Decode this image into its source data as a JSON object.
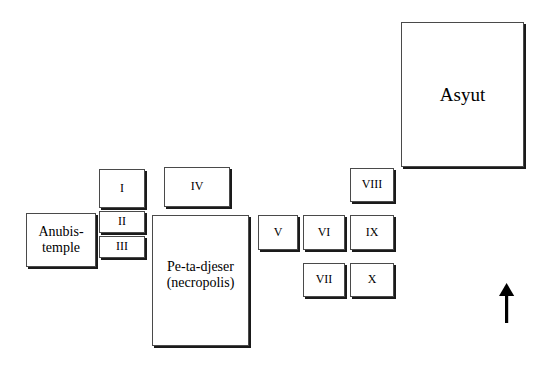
{
  "diagram": {
    "title_region": "Asyut site plan",
    "north_arrow": {
      "icon": "north-arrow-icon",
      "label": ""
    },
    "boxes": [
      {
        "id": "asyut",
        "label": "Asyut",
        "x": 401,
        "y": 22,
        "w": 123,
        "h": 145,
        "text_class": "big-title"
      },
      {
        "id": "box-i",
        "label": "I",
        "x": 99,
        "y": 169,
        "w": 46,
        "h": 39,
        "text_class": "roman"
      },
      {
        "id": "box-ii",
        "label": "II",
        "x": 99,
        "y": 211,
        "w": 46,
        "h": 22,
        "text_class": "roman"
      },
      {
        "id": "box-iii",
        "label": "III",
        "x": 99,
        "y": 236,
        "w": 46,
        "h": 22,
        "text_class": "roman"
      },
      {
        "id": "box-iv",
        "label": "IV",
        "x": 164,
        "y": 167,
        "w": 66,
        "h": 40,
        "text_class": "roman"
      },
      {
        "id": "anubis",
        "label": "Anubis-\ntemple",
        "x": 26,
        "y": 213,
        "w": 70,
        "h": 54,
        "text_class": "name-label"
      },
      {
        "id": "pe-ta-djeser",
        "label": "Pe-ta-djeser\n(necropolis)",
        "x": 152,
        "y": 215,
        "w": 97,
        "h": 131,
        "text_class": "necro-label"
      },
      {
        "id": "box-v",
        "label": "V",
        "x": 258,
        "y": 215,
        "w": 40,
        "h": 35,
        "text_class": "roman"
      },
      {
        "id": "box-vi",
        "label": "VI",
        "x": 303,
        "y": 215,
        "w": 42,
        "h": 35,
        "text_class": "roman"
      },
      {
        "id": "box-vii",
        "label": "VII",
        "x": 303,
        "y": 263,
        "w": 42,
        "h": 34,
        "text_class": "roman"
      },
      {
        "id": "box-viii",
        "label": "VIII",
        "x": 350,
        "y": 168,
        "w": 44,
        "h": 34,
        "text_class": "roman"
      },
      {
        "id": "box-ix",
        "label": "IX",
        "x": 350,
        "y": 215,
        "w": 44,
        "h": 35,
        "text_class": "roman"
      },
      {
        "id": "box-x",
        "label": "X",
        "x": 350,
        "y": 263,
        "w": 44,
        "h": 34,
        "text_class": "roman"
      }
    ],
    "colors": {
      "background": "#ffffff",
      "box_fill": "#ffffff",
      "box_stroke": "#4a4a4a",
      "box_shadow": "#1a1a1a",
      "text": "#000000",
      "arrow": "#000000"
    }
  }
}
